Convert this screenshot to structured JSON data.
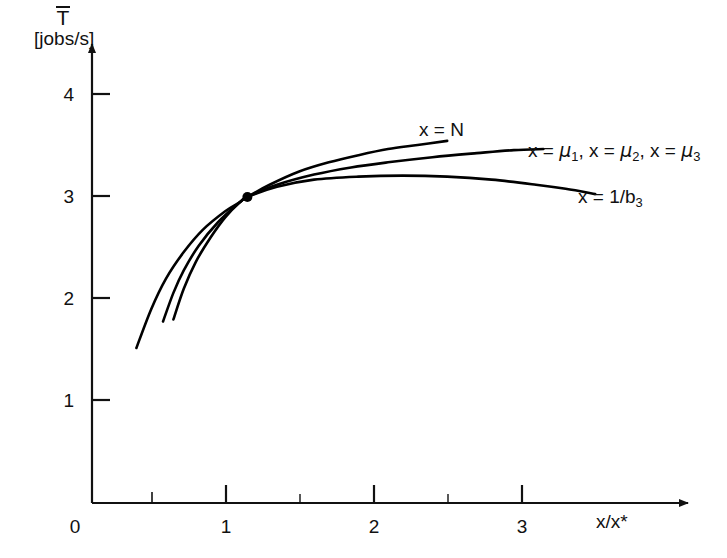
{
  "chart_data": {
    "type": "line",
    "title": "",
    "subtitle": "",
    "xlabel": "x/x*",
    "ylabel": "T̄ [jobs/s]",
    "ylabel_symbol": "T",
    "ylabel_unit": "[jobs/s]",
    "xlim": [
      0,
      3.6
    ],
    "ylim": [
      0,
      4.35
    ],
    "grid": false,
    "legend_position": "inline-right-of-curves",
    "x_ticks_major": [
      0,
      1,
      2,
      3
    ],
    "x_tick_labels": [
      "0",
      "1",
      "2",
      "3"
    ],
    "x_ticks_minor": [
      0.5,
      1.5,
      2.5
    ],
    "y_ticks_major": [
      1,
      2,
      3,
      4
    ],
    "y_tick_labels": [
      "1",
      "2",
      "3",
      "4"
    ],
    "y_ticks_minor": [],
    "annotations": [
      {
        "name": "optimum-point",
        "kind": "point-marker",
        "x": 1.05,
        "y": 3.0,
        "label": ""
      }
    ],
    "series": [
      {
        "name": "x = N",
        "label": "x = N",
        "label_plain": "x = N",
        "color": "#000000",
        "x": [
          0.55,
          0.62,
          0.7,
          0.8,
          0.9,
          1.0,
          1.05,
          1.2,
          1.4,
          1.6,
          1.8,
          2.0,
          2.2,
          2.4
        ],
        "y": [
          1.8,
          2.1,
          2.36,
          2.6,
          2.8,
          2.95,
          3.0,
          3.12,
          3.25,
          3.34,
          3.41,
          3.47,
          3.51,
          3.55
        ]
      },
      {
        "name": "x = mu_1, x = mu_2, x = mu_3",
        "label": "x = μ1, x = μ2, x = μ3",
        "label_plain": "x = mu1, x = mu2, x = mu3",
        "color": "#000000",
        "x": [
          0.48,
          0.55,
          0.62,
          0.72,
          0.85,
          1.0,
          1.05,
          1.25,
          1.5,
          1.75,
          2.0,
          2.3,
          2.6,
          2.85,
          3.05
        ],
        "y": [
          1.78,
          2.06,
          2.28,
          2.52,
          2.75,
          2.95,
          3.0,
          3.12,
          3.22,
          3.29,
          3.34,
          3.39,
          3.43,
          3.46,
          3.47
        ]
      },
      {
        "name": "x = 1/b_3",
        "label": "x = 1/b3",
        "label_plain": "x = 1/b3",
        "color": "#000000",
        "x": [
          0.3,
          0.4,
          0.5,
          0.62,
          0.75,
          0.9,
          1.0,
          1.05,
          1.25,
          1.5,
          1.8,
          2.1,
          2.4,
          2.7,
          3.0,
          3.2,
          3.4
        ],
        "y": [
          1.52,
          1.9,
          2.2,
          2.46,
          2.68,
          2.86,
          2.95,
          3.0,
          3.1,
          3.17,
          3.2,
          3.21,
          3.2,
          3.17,
          3.12,
          3.08,
          3.03
        ]
      }
    ]
  },
  "axes": {
    "y_title_symbol": "T",
    "y_title_unit": "[jobs/s]",
    "x_title": "x/x*",
    "x_tick_labels": [
      "0",
      "1",
      "2",
      "3"
    ],
    "y_tick_labels": [
      "1",
      "2",
      "3",
      "4"
    ],
    "origin_label": "0"
  },
  "curve_labels": {
    "n": {
      "prefix": "x = N"
    },
    "mu": {
      "part1_lhs": "x = ",
      "mu_symbol": "μ",
      "sub1": "1",
      "sep1": ", ",
      "part2_lhs": "x = ",
      "sub2": "2",
      "sep2": ", ",
      "part3_lhs": "x = ",
      "sub3": "3"
    },
    "b3": {
      "lhs": "x = 1/b",
      "sub": "3"
    }
  },
  "colors": {
    "curve": "#000000",
    "axis": "#111111",
    "background": "#ffffff",
    "text": "#111111"
  }
}
